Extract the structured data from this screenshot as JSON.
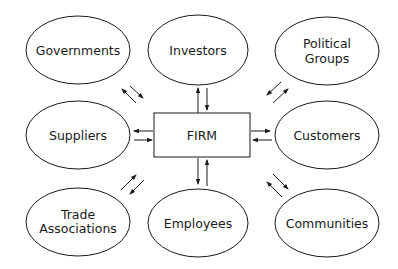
{
  "diagram": {
    "type": "stakeholder-map",
    "center": {
      "label": "FIRM"
    },
    "nodes": [
      {
        "id": "governments",
        "lines": [
          "Governments"
        ]
      },
      {
        "id": "investors",
        "lines": [
          "Investors"
        ]
      },
      {
        "id": "political-groups",
        "lines": [
          "Political",
          "Groups"
        ]
      },
      {
        "id": "suppliers",
        "lines": [
          "Suppliers"
        ]
      },
      {
        "id": "customers",
        "lines": [
          "Customers"
        ]
      },
      {
        "id": "trade-associations",
        "lines": [
          "Trade",
          "Associations"
        ]
      },
      {
        "id": "employees",
        "lines": [
          "Employees"
        ]
      },
      {
        "id": "communities",
        "lines": [
          "Communities"
        ]
      }
    ],
    "edges": [
      {
        "from": "FIRM",
        "to": "governments",
        "direction": "bidirectional"
      },
      {
        "from": "FIRM",
        "to": "investors",
        "direction": "bidirectional"
      },
      {
        "from": "FIRM",
        "to": "political-groups",
        "direction": "bidirectional"
      },
      {
        "from": "FIRM",
        "to": "suppliers",
        "direction": "bidirectional"
      },
      {
        "from": "FIRM",
        "to": "customers",
        "direction": "bidirectional"
      },
      {
        "from": "FIRM",
        "to": "trade-associations",
        "direction": "bidirectional"
      },
      {
        "from": "FIRM",
        "to": "employees",
        "direction": "bidirectional"
      },
      {
        "from": "FIRM",
        "to": "communities",
        "direction": "bidirectional"
      }
    ]
  }
}
